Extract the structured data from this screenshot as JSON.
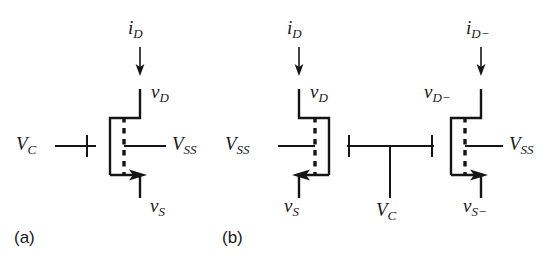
{
  "figure": {
    "type": "circuit-schematic",
    "background_color": "#ffffff",
    "line_color": "#151515"
  },
  "panels": [
    {
      "id": "a",
      "caption": "(a)",
      "labels": {
        "drain_current": "i",
        "drain_current_sub": "D",
        "drain_voltage": "v",
        "drain_voltage_sub": "D",
        "gate_voltage": "V",
        "gate_voltage_sub": "C",
        "bulk_voltage": "V",
        "bulk_voltage_sub": "SS",
        "source_voltage": "v",
        "source_voltage_sub": "S"
      }
    },
    {
      "id": "b",
      "caption": "(b)",
      "left_device": {
        "drain_current": "i",
        "drain_current_sub": "D",
        "drain_voltage": "v",
        "drain_voltage_sub": "D",
        "bulk_voltage": "V",
        "bulk_voltage_sub": "SS",
        "source_voltage": "v",
        "source_voltage_sub": "S"
      },
      "center_element": {
        "control_voltage": "V",
        "control_voltage_sub": "C"
      },
      "right_device": {
        "drain_current": "i",
        "drain_current_sub": "D−",
        "drain_voltage": "v",
        "drain_voltage_sub": "D−",
        "bulk_voltage": "V",
        "bulk_voltage_sub": "SS",
        "source_voltage": "v",
        "source_voltage_sub": "S−"
      }
    }
  ]
}
